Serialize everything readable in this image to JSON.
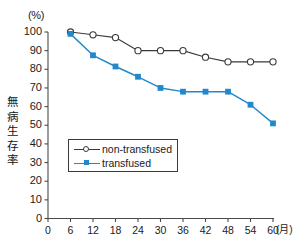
{
  "chart_data": {
    "type": "line",
    "title": "",
    "xlabel": "(月)",
    "ylabel": "無病生存率",
    "y_unit_label": "(%)",
    "x": [
      6,
      12,
      18,
      24,
      30,
      36,
      42,
      48,
      54,
      60
    ],
    "xlim": [
      0,
      60
    ],
    "ylim": [
      0,
      100
    ],
    "xticks": [
      "0",
      "6",
      "12",
      "18",
      "24",
      "30",
      "36",
      "42",
      "48",
      "54",
      "60"
    ],
    "yticks": [
      "0",
      "10",
      "20",
      "30",
      "40",
      "50",
      "60",
      "70",
      "80",
      "90",
      "100"
    ],
    "grid": false,
    "legend_position": "center-left",
    "series": [
      {
        "name": "non-transfused",
        "color": "#3a3a3a",
        "marker": "open-circle",
        "values": [
          100,
          98.5,
          97,
          90,
          90,
          90,
          86.5,
          84,
          84,
          84
        ]
      },
      {
        "name": "transfused",
        "color": "#2288cc",
        "marker": "filled-square",
        "values": [
          99,
          87.5,
          81.5,
          76,
          70,
          68,
          68,
          68,
          61,
          51
        ]
      }
    ]
  },
  "legend": {
    "items": [
      {
        "label": "non-transfused"
      },
      {
        "label": "transfused"
      }
    ]
  },
  "axes": {
    "y_unit": "(%)",
    "x_unit": "(月)",
    "y_axis_title": "無病生存率"
  },
  "colors": {
    "transfused": "#2288cc",
    "non_transfused": "#3a3a3a",
    "axis": "#4a4a4a",
    "background": "#ffffff"
  }
}
